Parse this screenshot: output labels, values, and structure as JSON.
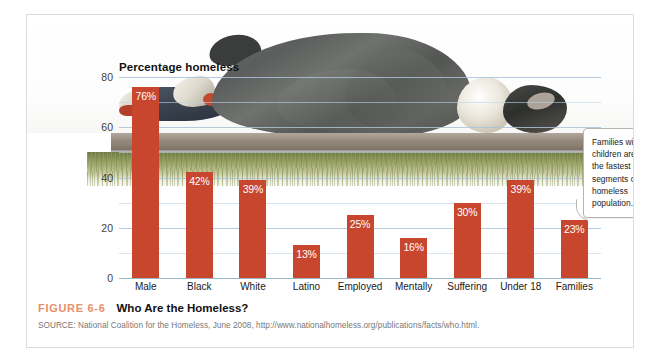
{
  "figure": {
    "number": "FIGURE 6-6",
    "title": "Who Are the Homeless?",
    "source": "SOURCE: National Coalition for the Homeless, June 2008, http://www.nationalhomeless.org/publications/facts/who.html.",
    "accent_color": "#e5906a",
    "bar_color": "#c8462e"
  },
  "callout": {
    "text": "Families with children are among the fastest growing segments of the homeless population."
  },
  "chart_data": {
    "type": "bar",
    "title": "Percentage homeless",
    "xlabel": "",
    "ylabel": "Percentage homeless",
    "ylim": [
      0,
      80
    ],
    "yticks": [
      0,
      20,
      40,
      60,
      80
    ],
    "ytick_labels": [
      "0",
      "20",
      "40",
      "60",
      "80"
    ],
    "grid": true,
    "minor_gridlines": [
      10,
      30,
      50,
      70
    ],
    "legend": "none",
    "categories": [
      "Male",
      "Black",
      "White",
      "Latino",
      "Employed",
      "Mentally ill",
      "Suffering addiction",
      "Under 18",
      "Families with children"
    ],
    "category_lines": [
      [
        "Male"
      ],
      [
        "Black"
      ],
      [
        "White"
      ],
      [
        "Latino"
      ],
      [
        "Employed"
      ],
      [
        "Mentally",
        "ill"
      ],
      [
        "Suffering",
        "addiction"
      ],
      [
        "Under 18"
      ],
      [
        "Families",
        "with children"
      ]
    ],
    "values": [
      76,
      42,
      39,
      13,
      25,
      16,
      30,
      39,
      23
    ],
    "value_labels": [
      "76%",
      "42%",
      "39%",
      "13%",
      "25%",
      "16%",
      "30%",
      "39%",
      "23%"
    ]
  },
  "photo": {
    "description": "homeless-person-sleeping-on-bench-photo"
  }
}
